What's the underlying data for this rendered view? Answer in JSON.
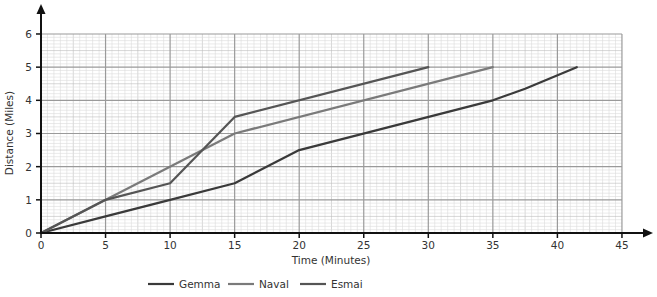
{
  "chart_data": {
    "type": "line",
    "title": "",
    "xlabel": "Time (Minutes)",
    "ylabel": "Distance (Miles)",
    "xlim": [
      0,
      45
    ],
    "ylim": [
      0,
      6
    ],
    "x_ticks": [
      0,
      5,
      10,
      15,
      20,
      25,
      30,
      35,
      40,
      45
    ],
    "y_ticks": [
      0,
      1,
      2,
      3,
      4,
      5,
      6
    ],
    "grid": true,
    "legend_position": "bottom",
    "series": [
      {
        "name": "Gemma",
        "color": "#3a3a3a",
        "points": [
          [
            0,
            0
          ],
          [
            5,
            0.5
          ],
          [
            10,
            1
          ],
          [
            15,
            1.5
          ],
          [
            20,
            2.5
          ],
          [
            35,
            4
          ],
          [
            37.5,
            4.35
          ],
          [
            41.5,
            5
          ]
        ]
      },
      {
        "name": "Naval",
        "color": "#7a7a7a",
        "points": [
          [
            0,
            0
          ],
          [
            15,
            3
          ],
          [
            35,
            5
          ]
        ]
      },
      {
        "name": "Esmai",
        "color": "#555555",
        "points": [
          [
            0,
            0
          ],
          [
            5,
            1
          ],
          [
            10,
            1.5
          ],
          [
            15,
            3.5
          ],
          [
            30,
            5
          ]
        ]
      }
    ]
  }
}
